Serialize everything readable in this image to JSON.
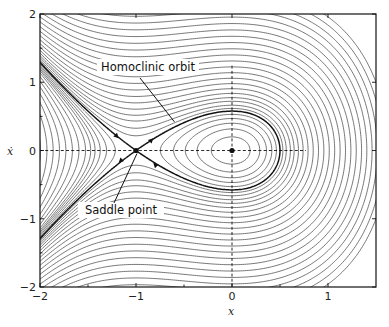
{
  "chart_data": {
    "type": "line",
    "subtype": "phase-portrait-contour",
    "title": "",
    "xlabel": "x",
    "ylabel": "ẋ",
    "xlim": [
      -2,
      1.5
    ],
    "ylim": [
      -2,
      2
    ],
    "x_ticks": [
      -2,
      -1,
      0,
      1
    ],
    "x_tick_labels": [
      "−2",
      "−1",
      "0",
      "1"
    ],
    "x_minor_ticks": [
      -1.5,
      -0.5,
      0.5
    ],
    "y_ticks": [
      -2,
      -1,
      0,
      1,
      2
    ],
    "y_tick_labels": [
      "−2",
      "−1",
      "0",
      "1",
      "2"
    ],
    "y_minor_ticks": [
      -1.5,
      -0.5,
      0.5,
      1.5
    ],
    "grid": false,
    "energy_function": "H = ẋ²/2 + x²/2 + x³/3",
    "contour_levels": [
      -0.95,
      -0.8,
      -0.66,
      -0.53,
      -0.42,
      -0.32,
      -0.23,
      -0.15,
      -0.08,
      -0.02,
      0.02,
      0.05,
      0.08,
      0.11,
      0.14,
      0.1667,
      0.19,
      0.22,
      0.26,
      0.3,
      0.35,
      0.41,
      0.48,
      0.56,
      0.65,
      0.75,
      0.86,
      0.98,
      1.11,
      1.25,
      1.4,
      1.56,
      1.73,
      1.91,
      2.1,
      2.3,
      2.52,
      2.75
    ],
    "homoclinic_level": 0.1667,
    "saddle_point": [
      -1,
      0
    ],
    "center_point": [
      0,
      0
    ],
    "homoclinic_right_extent": 0.5,
    "dashed_lines": {
      "horizontal": {
        "y": 0,
        "x_from": -2,
        "x_to": 0.77
      },
      "vertical": {
        "x": 0,
        "y_from": -2,
        "y_to": 1.25
      }
    },
    "annotations": [
      {
        "text": "Homoclinic orbit",
        "target": [
          -0.6,
          0.42
        ]
      },
      {
        "text": "Saddle point",
        "target": [
          -1,
          0
        ]
      }
    ]
  }
}
